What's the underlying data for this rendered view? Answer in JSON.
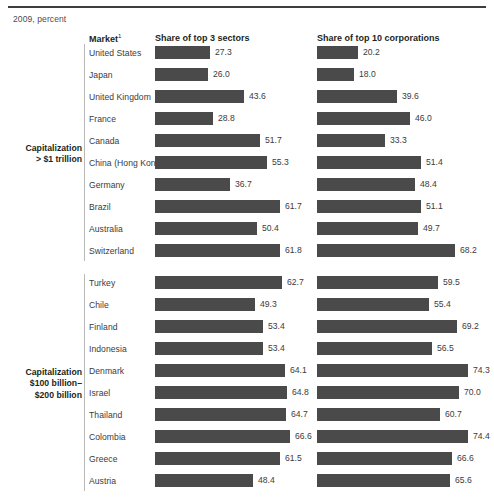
{
  "exhibit": {
    "unit_note": "2009, percent",
    "headers": {
      "market": "Market",
      "market_footnote": "1",
      "sectors": "Share of top 3 sectors",
      "corporations": "Share of top 10 corporations"
    }
  },
  "groups": [
    {
      "label_line1": "Capitalization",
      "label_line2": "> $1 trillion",
      "label_line3": "",
      "rows": [
        {
          "market": "United States",
          "sectors": "27.3",
          "corporations": "20.2"
        },
        {
          "market": "Japan",
          "sectors": "26.0",
          "corporations": "18.0"
        },
        {
          "market": "United Kingdom",
          "sectors": "43.6",
          "corporations": "39.6"
        },
        {
          "market": "France",
          "sectors": "28.8",
          "corporations": "46.0"
        },
        {
          "market": "Canada",
          "sectors": "51.7",
          "corporations": "33.3"
        },
        {
          "market": "China (Hong Kong)",
          "sectors": "55.3",
          "corporations": "51.4"
        },
        {
          "market": "Germany",
          "sectors": "36.7",
          "corporations": "48.4"
        },
        {
          "market": "Brazil",
          "sectors": "61.7",
          "corporations": "51.1"
        },
        {
          "market": "Australia",
          "sectors": "50.4",
          "corporations": "49.7"
        },
        {
          "market": "Switzerland",
          "sectors": "61.8",
          "corporations": "68.2"
        }
      ]
    },
    {
      "label_line1": "Capitalization",
      "label_line2": "$100 billion–",
      "label_line3": "$200 billion",
      "rows": [
        {
          "market": "Turkey",
          "sectors": "62.7",
          "corporations": "59.5"
        },
        {
          "market": "Chile",
          "sectors": "49.3",
          "corporations": "55.4"
        },
        {
          "market": "Finland",
          "sectors": "53.4",
          "corporations": "69.2"
        },
        {
          "market": "Indonesia",
          "sectors": "53.4",
          "corporations": "56.5"
        },
        {
          "market": "Denmark",
          "sectors": "64.1",
          "corporations": "74.3"
        },
        {
          "market": "Israel",
          "sectors": "64.8",
          "corporations": "70.0"
        },
        {
          "market": "Thailand",
          "sectors": "64.7",
          "corporations": "60.7"
        },
        {
          "market": "Colombia",
          "sectors": "66.6",
          "corporations": "74.4"
        },
        {
          "market": "Greece",
          "sectors": "61.5",
          "corporations": "66.6"
        },
        {
          "market": "Austria",
          "sectors": "48.4",
          "corporations": "65.6"
        }
      ]
    }
  ],
  "chart_data": {
    "type": "bar",
    "title": "",
    "subtitle": "2009, percent",
    "xlabel": "percent",
    "ylabel": "Market",
    "xlim": [
      0,
      80
    ],
    "grid": false,
    "legend": "none",
    "orientation": "horizontal",
    "panels": [
      {
        "group": "Capitalization > $1 trillion",
        "categories": [
          "United States",
          "Japan",
          "United Kingdom",
          "France",
          "Canada",
          "China (Hong Kong)",
          "Germany",
          "Brazil",
          "Australia",
          "Switzerland"
        ],
        "series": [
          {
            "name": "Share of top 3 sectors",
            "values": [
              27.3,
              26.0,
              43.6,
              28.8,
              51.7,
              55.3,
              36.7,
              61.7,
              50.4,
              61.8
            ]
          },
          {
            "name": "Share of top 10 corporations",
            "values": [
              20.2,
              18.0,
              39.6,
              46.0,
              33.3,
              51.4,
              48.4,
              51.1,
              49.7,
              68.2
            ]
          }
        ]
      },
      {
        "group": "Capitalization $100 billion–$200 billion",
        "categories": [
          "Turkey",
          "Chile",
          "Finland",
          "Indonesia",
          "Denmark",
          "Israel",
          "Thailand",
          "Colombia",
          "Greece",
          "Austria"
        ],
        "series": [
          {
            "name": "Share of top 3 sectors",
            "values": [
              62.7,
              49.3,
              53.4,
              53.4,
              64.1,
              64.8,
              64.7,
              66.6,
              61.5,
              48.4
            ]
          },
          {
            "name": "Share of top 10 corporations",
            "values": [
              59.5,
              55.4,
              69.2,
              56.5,
              74.3,
              70.0,
              60.7,
              74.4,
              66.6,
              65.6
            ]
          }
        ]
      }
    ],
    "colors": {
      "bar": "#4a4a4a",
      "rule": "#3d3d3d",
      "divider": "#b9b9b9"
    }
  }
}
